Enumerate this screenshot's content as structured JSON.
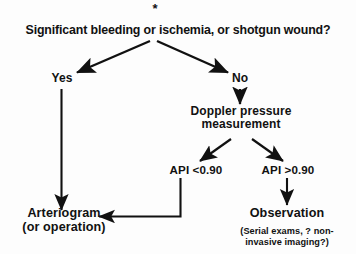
{
  "figure": {
    "type": "clinical-decision-flowchart",
    "background_color": "#fdfdfd",
    "ink_color": "#111111"
  },
  "nodes": {
    "footnote_marker": "*",
    "root_question": "Significant bleeding or ischemia, or shotgun wound?",
    "branch_yes": "Yes",
    "branch_no": "No",
    "doppler": {
      "line1": "Doppler pressure",
      "line2": "measurement"
    },
    "api_low": "API <0.90",
    "api_high": "API >0.90",
    "arteriogram": {
      "line1": "Arteriogram",
      "line2": "(or operation)"
    },
    "observation": {
      "title": "Observation",
      "caption_line1": "(Serial exams, ? non-",
      "caption_line2": "invasive imaging?)"
    }
  },
  "edges": [
    {
      "id": "root-to-yes",
      "from": "root_question",
      "to": "branch_yes",
      "style": "diagonal-arrow"
    },
    {
      "id": "root-to-no",
      "from": "root_question",
      "to": "branch_no",
      "style": "diagonal-arrow"
    },
    {
      "id": "yes-to-arteriogram",
      "from": "branch_yes",
      "to": "arteriogram",
      "style": "vertical-arrow"
    },
    {
      "id": "no-to-doppler",
      "from": "branch_no",
      "to": "doppler",
      "style": "vertical-arrow"
    },
    {
      "id": "doppler-to-api-low",
      "from": "doppler",
      "to": "api_low",
      "style": "diagonal-arrow"
    },
    {
      "id": "doppler-to-api-high",
      "from": "doppler",
      "to": "api_high",
      "style": "diagonal-arrow"
    },
    {
      "id": "api-low-to-arteriogram",
      "from": "api_low",
      "to": "arteriogram",
      "style": "elbow-arrow"
    },
    {
      "id": "api-high-to-observation",
      "from": "api_high",
      "to": "observation",
      "style": "vertical-arrow"
    }
  ]
}
